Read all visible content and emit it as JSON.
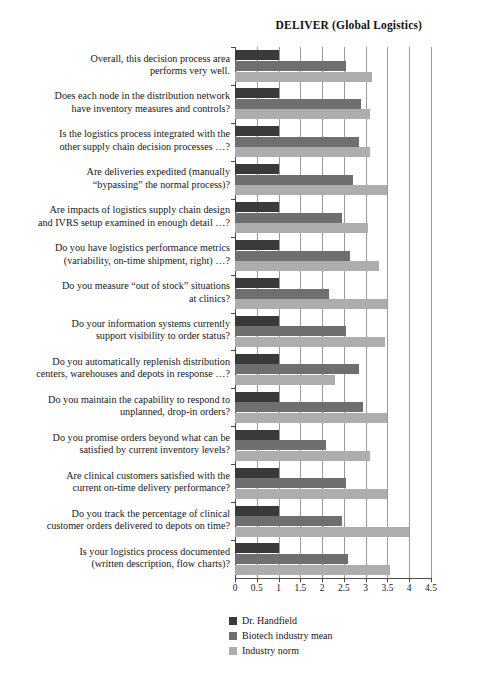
{
  "chart_data": {
    "type": "bar",
    "orientation": "horizontal",
    "title": "DELIVER (Global Logistics)",
    "xlabel": "",
    "ylabel": "",
    "xlim": [
      0,
      4.5
    ],
    "xticks": [
      "0",
      "0.5",
      "1",
      "1.5",
      "2",
      "2.5",
      "3",
      "3.5",
      "4",
      "4.5"
    ],
    "grid": true,
    "legend_position": "bottom-left",
    "categories": [
      "Overall, this decision process area performs very well.",
      "Does each node in the distribution network have inventory measures and controls?",
      "Is the logistics process integrated with the other supply chain decision processes …?",
      "Are deliveries expedited (manually “bypassing” the normal process)?",
      "Are impacts of logistics supply chain design and IVRS setup examined in enough detail …?",
      "Do you have logistics performance metrics (variability, on-time shipment, right) …?",
      "Do you measure “out of stock” situations at clinics?",
      "Do your information systems currently support visibility to order status?",
      "Do you automatically replenish distribution centers, warehouses and depots in response …?",
      "Do you maintain the capability to respond to unplanned, drop-in orders?",
      "Do you promise orders beyond what can be satisfied by current inventory levels?",
      "Are clinical customers satisfied with the current on-time delivery performance?",
      "Do you track the percentage of clinical customer orders delivered to depots on time?",
      "Is your logistics process documented (written description, flow charts)?"
    ],
    "category_lines": [
      [
        "Overall, this decision process area",
        "performs very well."
      ],
      [
        "Does each node in the distribution network",
        "have inventory measures and controls?"
      ],
      [
        "Is the logistics process integrated with the",
        "other supply chain decision processes …?"
      ],
      [
        "Are deliveries expedited (manually",
        "“bypassing” the normal process)?"
      ],
      [
        "Are impacts of logistics supply chain design",
        "and IVRS setup examined in enough detail …?"
      ],
      [
        "Do you have logistics performance metrics",
        "(variability, on-time shipment, right) …?"
      ],
      [
        "Do you measure “out of stock” situations",
        "at clinics?"
      ],
      [
        "Do your information systems currently",
        "support visibility to order status?"
      ],
      [
        "Do you automatically replenish distribution",
        "centers, warehouses and depots in response …?"
      ],
      [
        "Do you maintain the capability to respond to",
        "unplanned, drop-in orders?"
      ],
      [
        "Do you promise orders beyond what can be",
        "satisfied by current inventory levels?"
      ],
      [
        "Are clinical customers satisfied with the",
        "current on-time delivery performance?"
      ],
      [
        "Do you track the percentage of clinical",
        "customer orders delivered to depots on time?"
      ],
      [
        "Is your logistics process documented",
        "(written description, flow charts)?"
      ]
    ],
    "series": [
      {
        "name": "Dr. Handfield",
        "color": "#3a3a3a",
        "values": [
          1.0,
          1.0,
          1.0,
          1.0,
          1.0,
          1.0,
          1.0,
          1.0,
          1.0,
          1.0,
          1.0,
          1.0,
          1.0,
          1.0
        ]
      },
      {
        "name": "Biotech industry mean",
        "color": "#6f6f6f",
        "values": [
          2.55,
          2.9,
          2.85,
          2.7,
          2.45,
          2.65,
          2.15,
          2.55,
          2.85,
          2.95,
          2.1,
          2.55,
          2.45,
          2.6
        ]
      },
      {
        "name": "Industry norm",
        "color": "#adadad",
        "values": [
          3.15,
          3.1,
          3.1,
          3.5,
          3.05,
          3.3,
          3.5,
          3.45,
          2.3,
          3.5,
          3.1,
          3.5,
          4.0,
          3.55
        ]
      }
    ]
  }
}
